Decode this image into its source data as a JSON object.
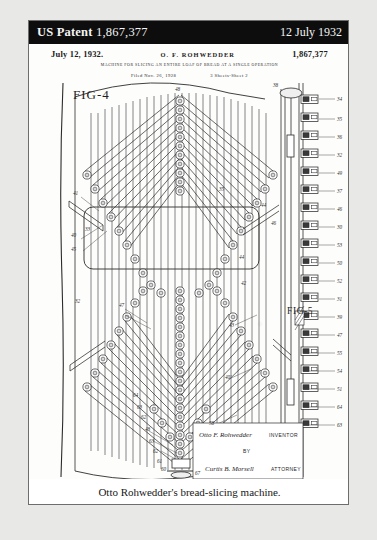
{
  "header": {
    "label": "US Patent",
    "patent_number": "1,867,377",
    "date": "12 July 1932"
  },
  "patent_sheet": {
    "issue_date": "July 12, 1932.",
    "inventor_name": "O. F. ROHWEDDER",
    "patent_number": "1,867,377",
    "title": "MACHINE FOR SLICING AN ENTIRE LOAF OF BREAD AT A SINGLE OPERATION",
    "filed": "Filed Nov. 26, 1928",
    "sheets": "3 Sheets-Sheet  2",
    "figures": [
      {
        "id": "fig-4",
        "label": "FIG-4"
      },
      {
        "id": "fig-5",
        "label": "FIG-5"
      }
    ],
    "signature_block": {
      "inventor_signature": "Otto F. Rohwedder",
      "inventor_label": "INVENTOR",
      "by_label": "BY",
      "attorney_signature": "Curtis B. Morsell",
      "attorney_label": "ATTORNEY"
    },
    "reference_numerals_left": [
      "41",
      "40",
      "45",
      "32",
      "33",
      "35",
      "47",
      "43",
      "40'",
      "48",
      "44",
      "63",
      "62",
      "61",
      "60",
      "67"
    ],
    "reference_numerals_center": [
      "48",
      "44",
      "46",
      "42",
      "38",
      "58",
      "62",
      "63",
      "64"
    ],
    "reference_numerals_right": [
      "34",
      "35",
      "36",
      "32",
      "49",
      "37",
      "46",
      "30",
      "53",
      "50",
      "52",
      "31",
      "39",
      "47",
      "55",
      "54",
      "51",
      "64",
      "63",
      "61",
      "60",
      "65",
      "59",
      "45",
      "48"
    ]
  },
  "caption": {
    "text": "Otto Rohwedder's bread-slicing machine."
  },
  "colors": {
    "header_bg": "#0d0d0d",
    "header_text": "#f4f4f4",
    "page_bg": "#ffffff",
    "frame_border": "#6d6d6d",
    "ink": "#2b2b2b",
    "backdrop": "#e8e8e6"
  }
}
